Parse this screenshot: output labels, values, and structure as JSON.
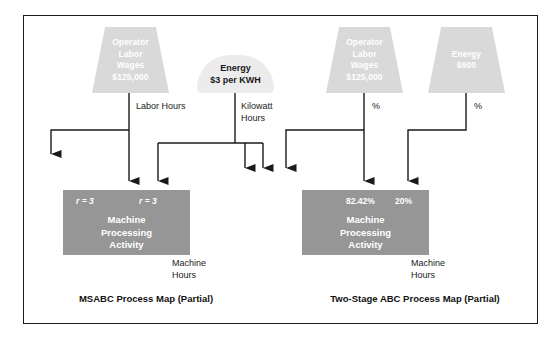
{
  "figure": {
    "background_color": "#ffffff",
    "frame_color": "#1a1a1a",
    "resource_fill": "#d9d9d9",
    "activity_fill": "#969696",
    "line_color": "#1a1a1a"
  },
  "left_panel": {
    "caption": "MSABC Process Map (Partial)",
    "resources": [
      {
        "shape": "trapezoid",
        "lines": [
          "Operator",
          "Labor",
          "Wages",
          "$125,000"
        ],
        "driver_label": [
          "Labor Hours"
        ]
      },
      {
        "shape": "rounded",
        "lines": [
          "Energy",
          "$3 per KWH"
        ],
        "driver_label": [
          "Kilowatt",
          "Hours"
        ]
      }
    ],
    "activity": {
      "lines": [
        "Machine",
        "Processing",
        "Activity"
      ],
      "driver_quantities": [
        "r = 3",
        "r = 3"
      ],
      "output_label": [
        "Machine",
        "Hours"
      ]
    }
  },
  "right_panel": {
    "caption": "Two-Stage ABC Process Map (Partial)",
    "resources": [
      {
        "shape": "trapezoid",
        "lines": [
          "Operator",
          "Labor",
          "Wages",
          "$125,000"
        ],
        "driver_label": [
          "%"
        ]
      },
      {
        "shape": "trapezoid",
        "lines": [
          "Energy",
          "$900"
        ],
        "driver_label": [
          "%"
        ]
      }
    ],
    "activity": {
      "lines": [
        "Machine",
        "Processing",
        "Activity"
      ],
      "driver_quantities": [
        "82.42%",
        "20%"
      ],
      "output_label": [
        "Machine",
        "Hours"
      ]
    }
  }
}
